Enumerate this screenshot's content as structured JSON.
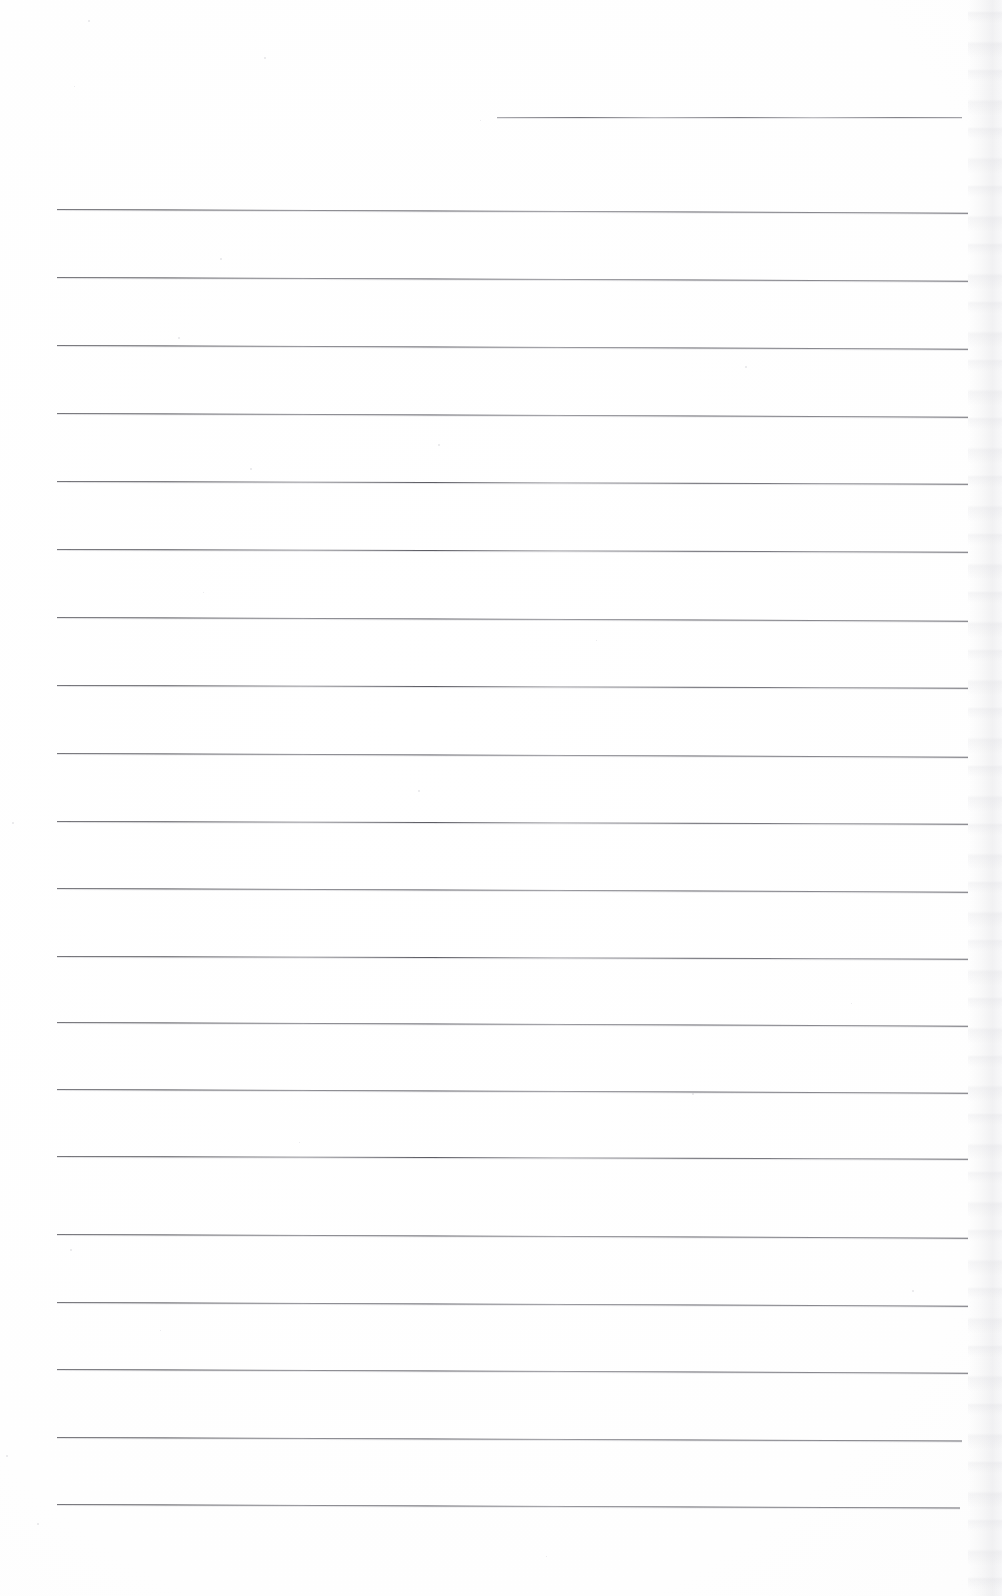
{
  "document": {
    "kind": "scanned-lined-paper",
    "title": "Blank ruled writing paper (scan)",
    "visible_text": "",
    "page_width": 1002,
    "page_height": 1596,
    "background_color": "#ffffff",
    "rule_color": "#5a5a62",
    "rule_thickness_px": 1,
    "rule_left_x": 57,
    "rule_right_x": 968,
    "rule_spacing_px": 67.5,
    "total_rules": 21,
    "right_edge_shadow_color": "#e2e2e6"
  },
  "rules": [
    {
      "index": 1,
      "y": 117,
      "x_start": 497,
      "x_end": 962,
      "short": true,
      "slope": 0.0,
      "soft": true
    },
    {
      "index": 2,
      "y": 209,
      "x_start": 57,
      "x_end": 968,
      "short": false,
      "slope": 0.004,
      "soft": false
    },
    {
      "index": 3,
      "y": 277,
      "x_start": 57,
      "x_end": 968,
      "short": false,
      "slope": 0.004,
      "soft": false
    },
    {
      "index": 4,
      "y": 345,
      "x_start": 57,
      "x_end": 968,
      "short": false,
      "slope": 0.004,
      "soft": false
    },
    {
      "index": 5,
      "y": 413,
      "x_start": 57,
      "x_end": 968,
      "short": false,
      "slope": 0.004,
      "soft": false
    },
    {
      "index": 6,
      "y": 481,
      "x_start": 57,
      "x_end": 968,
      "short": false,
      "slope": 0.003,
      "soft": false
    },
    {
      "index": 7,
      "y": 549,
      "x_start": 57,
      "x_end": 968,
      "short": false,
      "slope": 0.003,
      "soft": false
    },
    {
      "index": 8,
      "y": 617,
      "x_start": 57,
      "x_end": 968,
      "short": false,
      "slope": 0.004,
      "soft": false
    },
    {
      "index": 9,
      "y": 685,
      "x_start": 57,
      "x_end": 968,
      "short": false,
      "slope": 0.003,
      "soft": false
    },
    {
      "index": 10,
      "y": 753,
      "x_start": 57,
      "x_end": 968,
      "short": false,
      "slope": 0.004,
      "soft": false
    },
    {
      "index": 11,
      "y": 821,
      "x_start": 57,
      "x_end": 968,
      "short": false,
      "slope": 0.003,
      "soft": false
    },
    {
      "index": 12,
      "y": 888,
      "x_start": 57,
      "x_end": 968,
      "short": false,
      "slope": 0.004,
      "soft": false
    },
    {
      "index": 13,
      "y": 956,
      "x_start": 57,
      "x_end": 968,
      "short": false,
      "slope": 0.003,
      "soft": false
    },
    {
      "index": 14,
      "y": 1022,
      "x_start": 57,
      "x_end": 968,
      "short": false,
      "slope": 0.004,
      "soft": false
    },
    {
      "index": 15,
      "y": 1089,
      "x_start": 57,
      "x_end": 968,
      "short": false,
      "slope": 0.004,
      "soft": false
    },
    {
      "index": 16,
      "y": 1156,
      "x_start": 57,
      "x_end": 968,
      "short": false,
      "slope": 0.003,
      "soft": false
    },
    {
      "index": 17,
      "y": 1234,
      "x_start": 57,
      "x_end": 968,
      "short": false,
      "slope": 0.004,
      "soft": false
    },
    {
      "index": 18,
      "y": 1302,
      "x_start": 57,
      "x_end": 968,
      "short": false,
      "slope": 0.004,
      "soft": false
    },
    {
      "index": 19,
      "y": 1369,
      "x_start": 57,
      "x_end": 968,
      "short": false,
      "slope": 0.004,
      "soft": false
    },
    {
      "index": 20,
      "y": 1437,
      "x_start": 57,
      "x_end": 962,
      "short": false,
      "slope": 0.004,
      "soft": false
    },
    {
      "index": 21,
      "y": 1504,
      "x_start": 57,
      "x_end": 960,
      "short": false,
      "slope": 0.004,
      "soft": false
    }
  ],
  "specks": [
    {
      "x": 88,
      "y": 20,
      "size": 2
    },
    {
      "x": 264,
      "y": 57,
      "size": 2
    },
    {
      "x": 74,
      "y": 86,
      "size": 1
    },
    {
      "x": 220,
      "y": 258,
      "size": 2
    },
    {
      "x": 178,
      "y": 337,
      "size": 2
    },
    {
      "x": 438,
      "y": 444,
      "size": 2
    },
    {
      "x": 250,
      "y": 468,
      "size": 2
    },
    {
      "x": 203,
      "y": 592,
      "size": 1
    },
    {
      "x": 745,
      "y": 366,
      "size": 2
    },
    {
      "x": 596,
      "y": 640,
      "size": 1
    },
    {
      "x": 418,
      "y": 790,
      "size": 2
    },
    {
      "x": 12,
      "y": 822,
      "size": 2
    },
    {
      "x": 851,
      "y": 1003,
      "size": 1
    },
    {
      "x": 692,
      "y": 1093,
      "size": 2
    },
    {
      "x": 299,
      "y": 1142,
      "size": 1
    },
    {
      "x": 70,
      "y": 1249,
      "size": 2
    },
    {
      "x": 912,
      "y": 1290,
      "size": 2
    },
    {
      "x": 6,
      "y": 1455,
      "size": 2
    },
    {
      "x": 37,
      "y": 1523,
      "size": 2
    },
    {
      "x": 546,
      "y": 1556,
      "size": 1
    },
    {
      "x": 160,
      "y": 1330,
      "size": 1
    },
    {
      "x": 480,
      "y": 120,
      "size": 1
    }
  ]
}
